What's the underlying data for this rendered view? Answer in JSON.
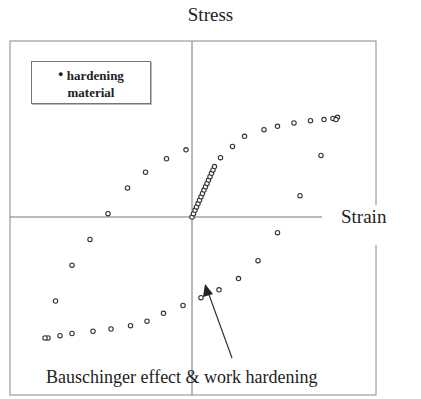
{
  "chart_data": {
    "type": "scatter",
    "title": "Stress",
    "xlabel": "Strain",
    "ylabel": "Stress",
    "legend": {
      "entries": [
        "hardening material"
      ],
      "position": "upper-left"
    },
    "annotation": "Bauschinger effect & work hardening",
    "grid": false,
    "xlim": [
      -1,
      1
    ],
    "ylim": [
      -1,
      1
    ],
    "series": [
      {
        "name": "hardening material",
        "points": [
          [
            0.0,
            0.0
          ],
          [
            0.01,
            0.03
          ],
          [
            0.02,
            0.06
          ],
          [
            0.03,
            0.09
          ],
          [
            0.04,
            0.12
          ],
          [
            0.05,
            0.15
          ],
          [
            0.06,
            0.18
          ],
          [
            0.07,
            0.21
          ],
          [
            0.08,
            0.24
          ],
          [
            0.09,
            0.27
          ],
          [
            0.1,
            0.3
          ],
          [
            0.11,
            0.33
          ],
          [
            0.12,
            0.36
          ],
          [
            0.13,
            0.39
          ],
          [
            0.14,
            0.42
          ],
          [
            0.15,
            0.45
          ],
          [
            0.19,
            0.53
          ],
          [
            0.27,
            0.63
          ],
          [
            0.35,
            0.72
          ],
          [
            0.48,
            0.78
          ],
          [
            0.57,
            0.81
          ],
          [
            0.68,
            0.84
          ],
          [
            0.79,
            0.86
          ],
          [
            0.88,
            0.87
          ],
          [
            0.94,
            0.88
          ],
          [
            0.97,
            0.89
          ],
          [
            0.96,
            0.87
          ],
          [
            0.86,
            0.55
          ],
          [
            0.72,
            0.19
          ],
          [
            0.57,
            -0.14
          ],
          [
            0.44,
            -0.39
          ],
          [
            0.31,
            -0.55
          ],
          [
            0.18,
            -0.65
          ],
          [
            0.06,
            -0.72
          ],
          [
            -0.06,
            -0.79
          ],
          [
            -0.19,
            -0.86
          ],
          [
            -0.3,
            -0.93
          ],
          [
            -0.41,
            -0.97
          ],
          [
            -0.54,
            -1.0
          ],
          [
            -0.66,
            -1.02
          ],
          [
            -0.8,
            -1.04
          ],
          [
            -0.88,
            -1.06
          ],
          [
            -0.96,
            -1.08
          ],
          [
            -0.98,
            -1.08
          ],
          [
            -0.91,
            -0.75
          ],
          [
            -0.8,
            -0.43
          ],
          [
            -0.68,
            -0.2
          ],
          [
            -0.56,
            0.03
          ],
          [
            -0.43,
            0.26
          ],
          [
            -0.31,
            0.4
          ],
          [
            -0.17,
            0.52
          ],
          [
            -0.04,
            0.6
          ]
        ]
      }
    ]
  }
}
